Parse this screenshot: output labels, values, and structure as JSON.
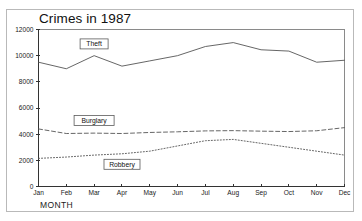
{
  "window": {
    "title": "Crimes in 1987"
  },
  "chart_data": {
    "type": "line",
    "title": "Crimes in 1987",
    "xlabel": "MONTH",
    "ylabel": "",
    "categories": [
      "Jan",
      "Feb",
      "Mar",
      "Apr",
      "May",
      "Jun",
      "Jul",
      "Aug",
      "Sep",
      "Oct",
      "Nov",
      "Dec"
    ],
    "ylim": [
      0,
      12000
    ],
    "yticks": [
      0,
      2000,
      4000,
      6000,
      8000,
      10000,
      12000
    ],
    "ytick_labels": [
      "0",
      "2000",
      "4000",
      "6000",
      "8000",
      "10000",
      "12000"
    ],
    "grid": false,
    "legend": "inline-labels",
    "series": [
      {
        "name": "Theft",
        "style": "solid",
        "values": [
          9500,
          9000,
          10000,
          9200,
          9600,
          10000,
          10700,
          11000,
          10450,
          10350,
          9500,
          9650
        ]
      },
      {
        "name": "Burglary",
        "style": "dashed",
        "values": [
          4400,
          4050,
          4080,
          4050,
          4130,
          4180,
          4250,
          4270,
          4230,
          4200,
          4260,
          4500
        ]
      },
      {
        "name": "Robbery",
        "style": "dotted",
        "values": [
          2150,
          2250,
          2400,
          2500,
          2700,
          3100,
          3500,
          3600,
          3300,
          3000,
          2700,
          2400
        ]
      }
    ],
    "annotations": [
      {
        "text": "Theft",
        "category": "Mar",
        "value": 10900
      },
      {
        "text": "Burglary",
        "category": "Mar",
        "value": 5050
      },
      {
        "text": "Robbery",
        "category": "Apr",
        "value": 1700
      }
    ]
  }
}
